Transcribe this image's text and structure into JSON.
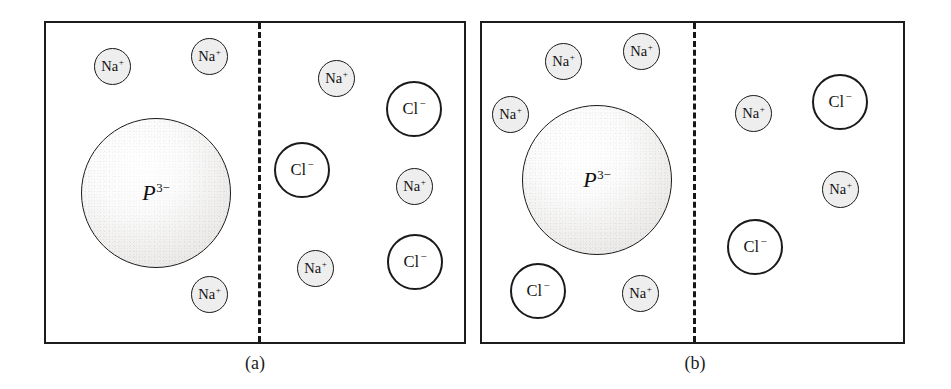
{
  "figure": {
    "panels": [
      {
        "id": "a",
        "caption": "(a)",
        "compartments": [
          {
            "side": "left",
            "ions": [
              {
                "name": "sodium-ion",
                "species": "Na",
                "charge": "+",
                "x": 48,
                "y": 25
              },
              {
                "name": "sodium-ion",
                "species": "Na",
                "charge": "+",
                "x": 145,
                "y": 15
              },
              {
                "name": "protein-ion",
                "species": "P",
                "charge": "3−",
                "x": 35,
                "y": 95
              },
              {
                "name": "sodium-ion",
                "species": "Na",
                "charge": "+",
                "x": 145,
                "y": 253
              }
            ]
          },
          {
            "side": "right",
            "ions": [
              {
                "name": "sodium-ion",
                "species": "Na",
                "charge": "+",
                "x": 272,
                "y": 37
              },
              {
                "name": "chloride-ion",
                "species": "Cl",
                "charge": "−",
                "x": 340,
                "y": 58
              },
              {
                "name": "chloride-ion",
                "species": "Cl",
                "charge": "−",
                "x": 228,
                "y": 119
              },
              {
                "name": "sodium-ion",
                "species": "Na",
                "charge": "+",
                "x": 350,
                "y": 145
              },
              {
                "name": "sodium-ion",
                "species": "Na",
                "charge": "+",
                "x": 251,
                "y": 227
              },
              {
                "name": "chloride-ion",
                "species": "Cl",
                "charge": "−",
                "x": 341,
                "y": 211
              }
            ]
          }
        ]
      },
      {
        "id": "b",
        "caption": "(b)",
        "compartments": [
          {
            "side": "left",
            "ions": [
              {
                "name": "sodium-ion",
                "species": "Na",
                "charge": "+",
                "x": 63,
                "y": 20
              },
              {
                "name": "sodium-ion",
                "species": "Na",
                "charge": "+",
                "x": 141,
                "y": 10
              },
              {
                "name": "sodium-ion",
                "species": "Na",
                "charge": "+",
                "x": 10,
                "y": 73
              },
              {
                "name": "protein-ion",
                "species": "P",
                "charge": "3−",
                "x": 40,
                "y": 82
              },
              {
                "name": "chloride-ion",
                "species": "Cl",
                "charge": "−",
                "x": 28,
                "y": 240
              },
              {
                "name": "sodium-ion",
                "species": "Na",
                "charge": "+",
                "x": 140,
                "y": 252
              }
            ]
          },
          {
            "side": "right",
            "ions": [
              {
                "name": "sodium-ion",
                "species": "Na",
                "charge": "+",
                "x": 253,
                "y": 72
              },
              {
                "name": "chloride-ion",
                "species": "Cl",
                "charge": "−",
                "x": 330,
                "y": 51
              },
              {
                "name": "sodium-ion",
                "species": "Na",
                "charge": "+",
                "x": 340,
                "y": 148
              },
              {
                "name": "chloride-ion",
                "species": "Cl",
                "charge": "−",
                "x": 245,
                "y": 196
              }
            ]
          }
        ]
      }
    ],
    "membrane_label": "semipermeable-membrane",
    "colors": {
      "frame": "#1c1c1c",
      "membrane": "#171717",
      "sodium_fill": "#eeeeee",
      "chloride_fill": "#ffffff",
      "protein_fill": "#e8e6e4",
      "text": "#131313",
      "background": "#ffffff"
    }
  }
}
